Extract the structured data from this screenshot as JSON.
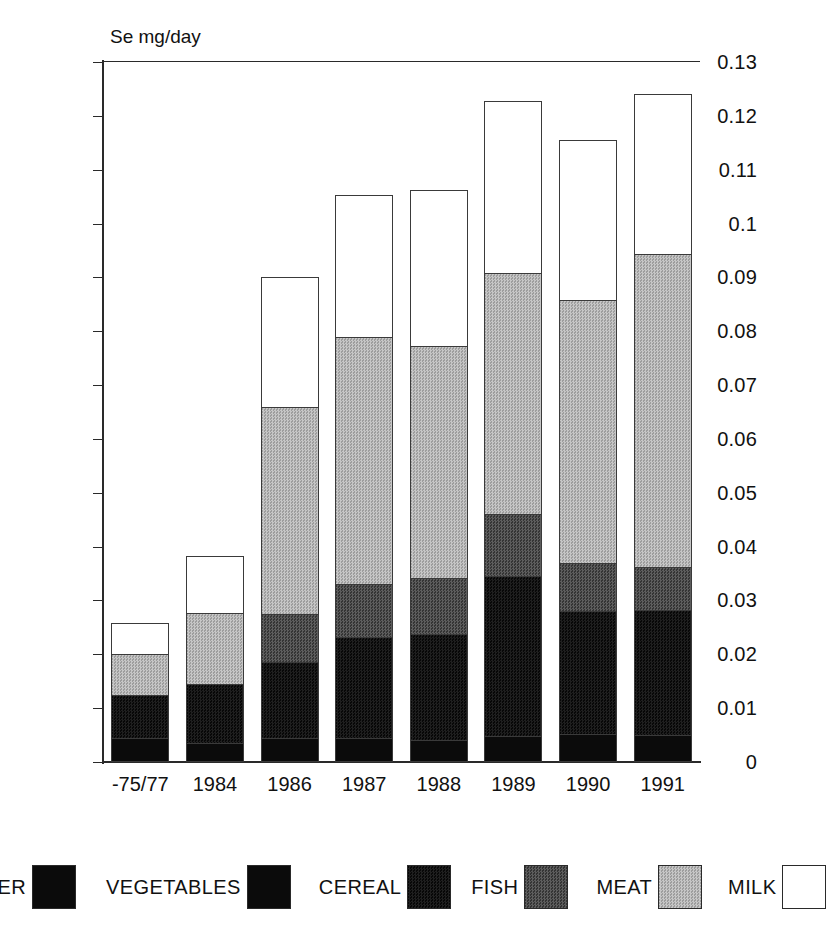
{
  "chart_data": {
    "type": "bar",
    "subtype": "stacked-bar",
    "title": "",
    "axis_note": "Se mg/day",
    "xlabel": "",
    "ylabel": "Se mg/day",
    "ylim": [
      0,
      0.13
    ],
    "grid": false,
    "legend_position": "bottom",
    "categories": [
      "-75/77",
      "1984",
      "1986",
      "1987",
      "1988",
      "1989",
      "1990",
      "1991"
    ],
    "ytick_labels": [
      "0.13",
      "0.12",
      "0.11",
      "0.1",
      "0.09",
      "0.08",
      "0.07",
      "0.06",
      "0.05",
      "0.04",
      "0.03",
      "0.02",
      "0.01",
      "0"
    ],
    "ytick_values": [
      0.13,
      0.12,
      0.11,
      0.1,
      0.09,
      0.08,
      0.07,
      0.06,
      0.05,
      0.04,
      0.03,
      0.02,
      0.01,
      0
    ],
    "series": [
      {
        "name": "OTHER",
        "fill": "fill-other",
        "color": "#0b0b0b",
        "values": [
          0.0045,
          0.0035,
          0.0045,
          0.0045,
          0.004,
          0.0048,
          0.0052,
          0.005
        ]
      },
      {
        "name": "VEGETABLES",
        "fill": "fill-vegetables",
        "color": "#0b0b0b",
        "values": [
          0.0,
          0.0,
          0.0,
          0.0,
          0.0,
          0.0,
          0.0,
          0.0
        ]
      },
      {
        "name": "CEREAL",
        "fill": "fill-cereal",
        "color": "#141414",
        "values": [
          0.008,
          0.011,
          0.014,
          0.0187,
          0.0198,
          0.0298,
          0.0228,
          0.0233
        ]
      },
      {
        "name": "FISH",
        "fill": "fill-fish",
        "color": "#4a4a4a",
        "values": [
          0.0,
          0.0,
          0.009,
          0.0098,
          0.0104,
          0.0114,
          0.009,
          0.008
        ]
      },
      {
        "name": "MEAT",
        "fill": "fill-meat",
        "color": "#b3b3b3",
        "values": [
          0.0075,
          0.0132,
          0.0385,
          0.046,
          0.043,
          0.0448,
          0.0488,
          0.058
        ]
      },
      {
        "name": "MILK",
        "fill": "fill-milk",
        "color": "#ffffff",
        "values": [
          0.0059,
          0.0106,
          0.024,
          0.0263,
          0.029,
          0.0319,
          0.0297,
          0.0297
        ]
      }
    ],
    "totals": [
      0.0259,
      0.0383,
      0.09,
      0.1053,
      0.1062,
      0.1227,
      0.1155,
      0.124
    ]
  },
  "legend": {
    "items": [
      {
        "label": "OTHER",
        "fill": "fill-other"
      },
      {
        "label": "VEGETABLES",
        "fill": "fill-vegetables"
      },
      {
        "label": "CEREAL",
        "fill": "fill-cereal"
      },
      {
        "label": "FISH",
        "fill": "fill-fish"
      },
      {
        "label": "MEAT",
        "fill": "fill-meat"
      },
      {
        "label": "MILK",
        "fill": "fill-milk"
      }
    ]
  }
}
